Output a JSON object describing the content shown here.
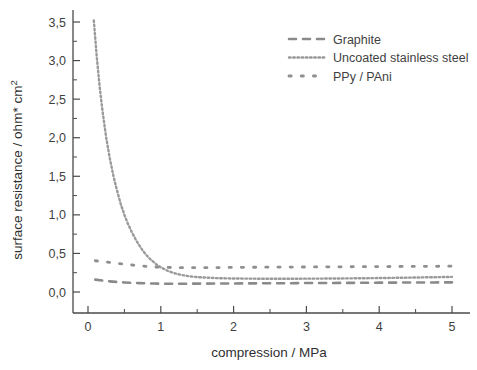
{
  "chart_data": {
    "type": "line",
    "title": "",
    "xlabel": "compression / MPa",
    "ylabel": "surface resistance / ohm* cm²",
    "ylabel_main": "surface resistance / ohm* cm",
    "ylabel_sup": "2",
    "xlim": [
      -0.25,
      5.3
    ],
    "ylim": [
      0.0,
      3.65
    ],
    "xticks": [
      0,
      1,
      2,
      3,
      4,
      5
    ],
    "xtick_labels": [
      "0",
      "1",
      "2",
      "3",
      "4",
      "5"
    ],
    "xminor_ticks": [
      0.5,
      1.5,
      2.5,
      3.5,
      4.5
    ],
    "yticks": [
      0.0,
      0.5,
      1.0,
      1.5,
      2.0,
      2.5,
      3.0,
      3.5
    ],
    "ytick_labels": [
      "0,0",
      "0,5",
      "1,0",
      "1,5",
      "2,0",
      "2,5",
      "3,0",
      "3,5"
    ],
    "yminor_ticks": [
      0.25,
      0.75,
      1.25,
      1.75,
      2.25,
      2.75,
      3.25
    ],
    "grid": false,
    "legend_position": "top-right",
    "decimal_separator": ",",
    "series": [
      {
        "name": "Graphite",
        "dash_style": "dashed",
        "color": "#8a8a8a",
        "stroke_width": 2.6,
        "dasharray": "7,7",
        "x": [
          0.1,
          0.2,
          0.3,
          0.4,
          0.5,
          0.6,
          0.7,
          0.8,
          0.9,
          1.0,
          1.2,
          1.4,
          1.6,
          1.8,
          2.0,
          2.25,
          2.5,
          2.75,
          3.0,
          3.25,
          3.5,
          3.75,
          4.0,
          4.25,
          4.5,
          4.75,
          5.0
        ],
        "values": [
          0.16,
          0.148,
          0.138,
          0.13,
          0.124,
          0.119,
          0.115,
          0.112,
          0.11,
          0.108,
          0.107,
          0.108,
          0.109,
          0.11,
          0.111,
          0.112,
          0.113,
          0.114,
          0.116,
          0.117,
          0.118,
          0.119,
          0.121,
          0.122,
          0.123,
          0.124,
          0.125
        ]
      },
      {
        "name": "Uncoated stainless steel",
        "dash_style": "fine-dotted",
        "color": "#9a9a9a",
        "stroke_width": 2.4,
        "dasharray": "1.6,2.6",
        "x": [
          0.08,
          0.12,
          0.16,
          0.2,
          0.25,
          0.3,
          0.35,
          0.4,
          0.45,
          0.5,
          0.55,
          0.6,
          0.65,
          0.7,
          0.75,
          0.8,
          0.85,
          0.9,
          0.95,
          1.0,
          1.1,
          1.2,
          1.3,
          1.4,
          1.5,
          1.75,
          2.0,
          2.25,
          2.5,
          2.75,
          3.0,
          3.25,
          3.5,
          3.75,
          4.0,
          4.25,
          4.5,
          4.75,
          5.0
        ],
        "values": [
          3.52,
          3.05,
          2.66,
          2.34,
          2.0,
          1.73,
          1.5,
          1.31,
          1.14,
          1.0,
          0.88,
          0.78,
          0.69,
          0.61,
          0.54,
          0.48,
          0.43,
          0.39,
          0.35,
          0.32,
          0.272,
          0.24,
          0.218,
          0.203,
          0.193,
          0.18,
          0.175,
          0.173,
          0.172,
          0.172,
          0.173,
          0.174,
          0.176,
          0.178,
          0.181,
          0.184,
          0.188,
          0.192,
          0.196
        ]
      },
      {
        "name": "PPy / PAni",
        "dash_style": "sparse-dotted",
        "color": "#8f8f8f",
        "stroke_width": 2.8,
        "dasharray": "2.2,10",
        "x": [
          0.1,
          0.3,
          0.5,
          0.7,
          0.9,
          1.1,
          1.3,
          1.5,
          1.7,
          1.9,
          2.1,
          2.3,
          2.5,
          2.7,
          2.9,
          3.1,
          3.3,
          3.5,
          3.7,
          3.9,
          4.1,
          4.3,
          4.5,
          4.7,
          4.9,
          5.05
        ],
        "values": [
          0.405,
          0.385,
          0.36,
          0.34,
          0.325,
          0.318,
          0.315,
          0.315,
          0.316,
          0.318,
          0.32,
          0.321,
          0.322,
          0.323,
          0.324,
          0.325,
          0.326,
          0.327,
          0.328,
          0.329,
          0.33,
          0.331,
          0.332,
          0.333,
          0.334,
          0.335
        ]
      }
    ]
  },
  "legend": {
    "items": [
      {
        "label": "Graphite"
      },
      {
        "label": "Uncoated stainless steel"
      },
      {
        "label": "PPy / PAni"
      }
    ]
  }
}
